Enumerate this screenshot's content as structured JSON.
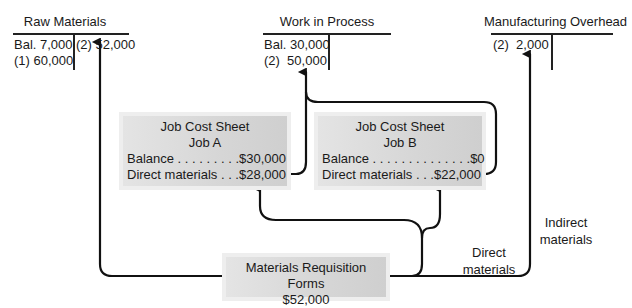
{
  "accounts": {
    "raw_materials": {
      "title": "Raw Materials",
      "debit": [
        "Bal. 7,000",
        "(1) 60,000"
      ],
      "credit": [
        "(2) 52,000"
      ]
    },
    "work_in_process": {
      "title": "Work in Process",
      "debit": [
        "Bal. 30,000",
        "(2)  50,000"
      ],
      "credit": []
    },
    "manufacturing_overhead": {
      "title": "Manufacturing Overhead",
      "debit": [
        "(2)  2,000"
      ],
      "credit": []
    }
  },
  "job_cost_sheets": [
    {
      "title": "Job Cost Sheet",
      "job": "Job A",
      "balance_label": "Balance . . . . . . . . .",
      "balance_value": "$30,000",
      "dm_label": "Direct materials . . .",
      "dm_value": "$28,000"
    },
    {
      "title": "Job Cost Sheet",
      "job": "Job B",
      "balance_label": "Balance . . . . . . . . . . . . . .",
      "balance_value": "$0",
      "dm_label": "Direct materials . . .",
      "dm_value": "$22,000"
    }
  ],
  "requisition": {
    "title": "Materials Requisition Forms",
    "amount": "$52,000"
  },
  "flow_labels": {
    "direct_line1": "Direct",
    "direct_line2": "materials",
    "indirect_line1": "Indirect",
    "indirect_line2": "materials"
  },
  "colors": {
    "line": "#111111",
    "box_fill": "#d9d9d9",
    "box_halo": "#eeeeee"
  }
}
